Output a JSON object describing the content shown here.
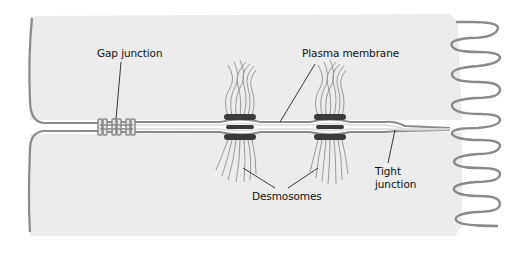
{
  "diagram": {
    "type": "biology-cell-junctions",
    "colors": {
      "background": "#ffffff",
      "cytoplasm": "#ececec",
      "membrane": "#8a8a8a",
      "membrane_light": "#d9d9d9",
      "desmosome_plaque": "#3a3a3a",
      "filament": "#9a9a9a",
      "leader_line": "#222222",
      "text": "#111111"
    },
    "labels": {
      "gap_junction": "Gap junction",
      "plasma_membrane": "Plasma membrane",
      "desmosomes": "Desmosomes",
      "tight_junction_line1": "Tight",
      "tight_junction_line2": "junction"
    },
    "structures": [
      {
        "name": "gap-junction",
        "x": 116,
        "y": 127
      },
      {
        "name": "desmosome",
        "x": 240,
        "y": 127
      },
      {
        "name": "desmosome",
        "x": 330,
        "y": 127
      },
      {
        "name": "tight-junction",
        "x": 395,
        "y": 129
      },
      {
        "name": "microvilli",
        "x": 475,
        "y": 120
      }
    ]
  }
}
